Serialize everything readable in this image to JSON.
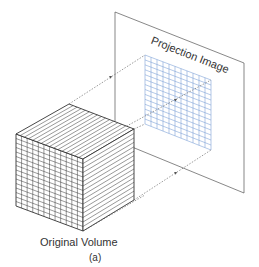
{
  "diagram": {
    "title_label": "Projection Image",
    "volume_label": "Original Volume",
    "caption": "(a)",
    "colors": {
      "line": "#333333",
      "grid_blue": "#7fa3d6",
      "arrow": "#555555"
    },
    "cube": {
      "front_columns": 12,
      "front_rows": 16,
      "top_lines": 16,
      "side_lines": 16
    },
    "projection_grid": {
      "columns": 11,
      "rows": 14
    }
  }
}
